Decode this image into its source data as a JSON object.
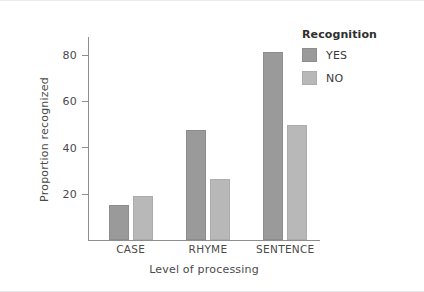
{
  "chart_data": {
    "type": "bar",
    "title": "",
    "xlabel": "Level of processing",
    "ylabel": "Proportion recognized",
    "categories": [
      "CASE",
      "RHYME",
      "SENTENCE"
    ],
    "series": [
      {
        "name": "YES",
        "color": "#9a9a9a",
        "values": [
          15,
          47.5,
          81
        ]
      },
      {
        "name": "NO",
        "color": "#b8b8b8",
        "values": [
          19,
          26.5,
          49.5
        ]
      }
    ],
    "ylim": [
      0,
      88
    ],
    "yticks": [
      20,
      40,
      60,
      80
    ],
    "ytick_labels": [
      "20",
      "40",
      "60",
      "80"
    ],
    "grid": false,
    "legend_position": "right",
    "legend_title": "Recognition"
  },
  "legend": {
    "title": "Recognition",
    "entries": [
      {
        "label": "YES",
        "color": "#9a9a9a"
      },
      {
        "label": "NO",
        "color": "#b8b8b8"
      }
    ]
  },
  "axes": {
    "x_title": "Level of processing",
    "y_title": "Proportion recognized",
    "y_ticks": [
      "20",
      "40",
      "60",
      "80"
    ],
    "x_categories": [
      "CASE",
      "RHYME",
      "SENTENCE"
    ]
  }
}
